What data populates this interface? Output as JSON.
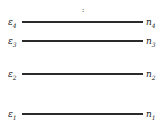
{
  "diagram": {
    "type": "energy-level-diagram",
    "ellipsis": ":",
    "levels": [
      {
        "energy": "ε",
        "energy_sub": "4",
        "occupancy": "n",
        "occupancy_sub": "4",
        "y": 16
      },
      {
        "energy": "ε",
        "energy_sub": "3",
        "occupancy": "n",
        "occupancy_sub": "3",
        "y": 35
      },
      {
        "energy": "ε",
        "energy_sub": "2",
        "occupancy": "n",
        "occupancy_sub": "2",
        "y": 68
      },
      {
        "energy": "ε",
        "energy_sub": "1",
        "occupancy": "n",
        "occupancy_sub": "1",
        "y": 108
      }
    ],
    "line_color": "#2a2a2a"
  }
}
